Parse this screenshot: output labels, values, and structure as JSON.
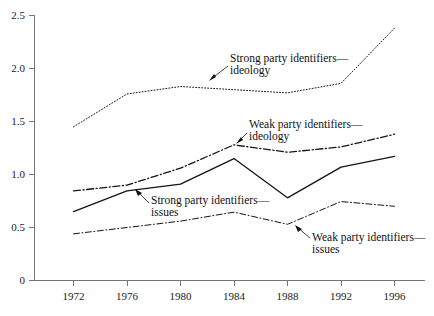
{
  "chart_data": {
    "type": "line",
    "title": "",
    "subtitle": "",
    "xlabel": "",
    "ylabel": "",
    "x": [
      1972,
      1976,
      1980,
      1984,
      1988,
      1992,
      1996
    ],
    "categories": [
      "1972",
      "1976",
      "1980",
      "1984",
      "1988",
      "1992",
      "1996"
    ],
    "xlim": [
      1970,
      1998
    ],
    "ylim": [
      0,
      2.5
    ],
    "ytick_values": [
      0,
      0.5,
      1.0,
      1.5,
      2.0,
      2.5
    ],
    "ytick_labels": [
      "0",
      "0.5",
      "1.0",
      "1.5",
      "2.0",
      "2.5"
    ],
    "xtick_labels": [
      "1972",
      "1976",
      "1980",
      "1984",
      "1988",
      "1992",
      "1996"
    ],
    "grid": false,
    "legend": "annotations",
    "series": [
      {
        "name": "Strong party identifiers—ideology",
        "style": "dotted",
        "values": [
          1.45,
          1.76,
          1.83,
          1.8,
          1.77,
          1.86,
          2.38
        ]
      },
      {
        "name": "Weak party identifiers—ideology",
        "style": "dash-dot",
        "values": [
          0.845,
          0.9,
          1.06,
          1.28,
          1.21,
          1.26,
          1.38
        ]
      },
      {
        "name": "Strong party identifiers—issues",
        "style": "solid",
        "values": [
          0.65,
          0.845,
          0.91,
          1.15,
          0.78,
          1.07,
          1.17
        ]
      },
      {
        "name": "Weak party identifiers—issues",
        "style": "dash-dot-thin",
        "values": [
          0.44,
          0.5,
          0.56,
          0.645,
          0.53,
          0.745,
          0.7
        ]
      }
    ],
    "annotations": [
      {
        "label_line1": "Strong party identifiers—",
        "label_line2": "ideology",
        "points_to_series": "Strong party identifiers—ideology"
      },
      {
        "label_line1": "Weak party identifiers—",
        "label_line2": "ideology",
        "points_to_series": "Weak party identifiers—ideology"
      },
      {
        "label_line1": "Strong party identifiers—",
        "label_line2": "issues",
        "points_to_series": "Strong party identifiers—issues"
      },
      {
        "label_line1": "Weak party identifiers—",
        "label_line2": "issues",
        "points_to_series": "Weak party identifiers—issues"
      }
    ],
    "colors": {
      "line": "#141414",
      "axis": "#767676",
      "text": "#1a1a1a",
      "background": "#ffffff"
    }
  }
}
